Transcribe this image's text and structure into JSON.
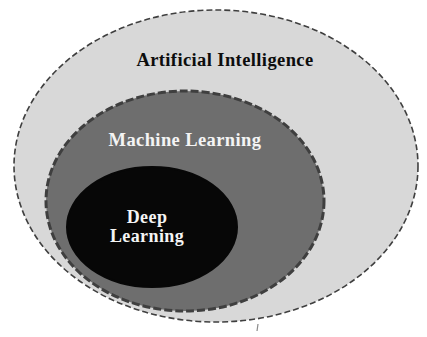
{
  "diagram": {
    "type": "nested_euler_diagram",
    "background": "#ffffff",
    "outline_color": "#3f3f3f",
    "sets": [
      {
        "id": "artificial-intelligence",
        "label": "Artificial Intelligence",
        "level": "outer",
        "fill": "#d8d8d8",
        "text_color": "#0d0d0d"
      },
      {
        "id": "machine-learning",
        "label": "Machine Learning",
        "level": "middle",
        "fill": "#6e6e6e",
        "text_color": "#f4f4f4"
      },
      {
        "id": "deep-learning",
        "label": "Deep Learning",
        "lines": {
          "line1": "Deep",
          "line2": "Learning"
        },
        "level": "inner",
        "fill": "#070707",
        "text_color": "#f4f4f4"
      }
    ]
  }
}
